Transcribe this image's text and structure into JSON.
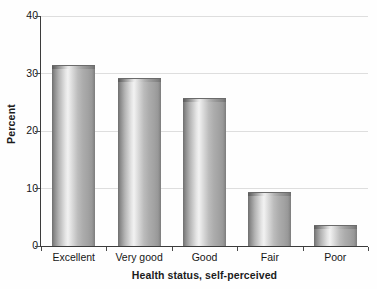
{
  "chart_data": {
    "type": "bar",
    "title": "",
    "xlabel": "Health status, self-perceived",
    "ylabel": "Percent",
    "categories": [
      "Excellent",
      "Very good",
      "Good",
      "Fair",
      "Poor"
    ],
    "values": [
      31.4,
      29.3,
      25.7,
      9.4,
      3.7
    ],
    "ylim": [
      0,
      40
    ],
    "yticks": [
      0,
      10,
      20,
      30,
      40
    ],
    "ytick_labels": [
      "0",
      "10",
      "20",
      "30",
      "40"
    ],
    "grid": "horizontal",
    "legend": "none",
    "bar_style": "3d-cylinder-gradient-gray",
    "colors": {
      "bar_light": "#f2f2f2",
      "bar_mid": "#b4b4b4",
      "bar_dark": "#6f6f6f",
      "gridline": "#dedede",
      "axis": "#3c3c3c",
      "text": "#161616",
      "background": "#ffffff"
    }
  }
}
